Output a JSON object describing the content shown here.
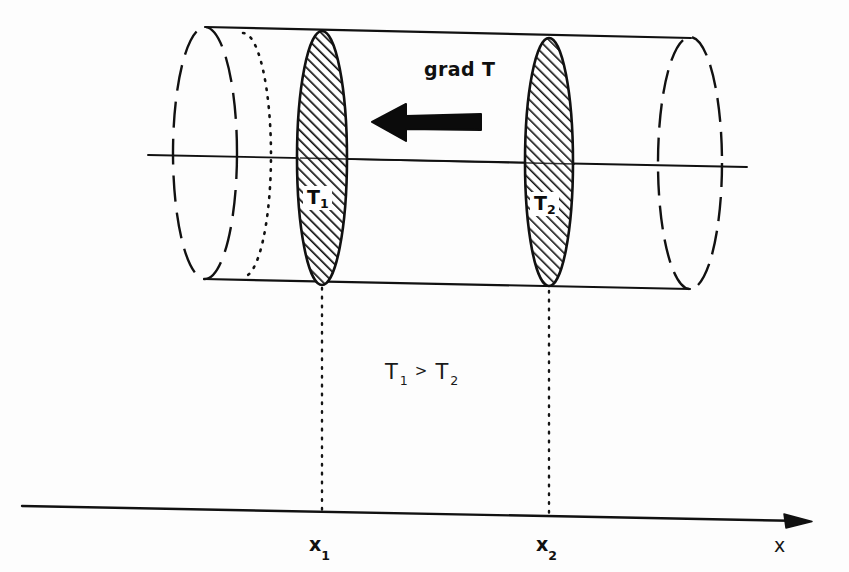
{
  "figure": {
    "background_color": "#fdfdfd",
    "ink_color": "#111111"
  },
  "labels": {
    "gradient": "grad T",
    "section_1": "T",
    "section_1_sub": "1",
    "section_2": "T",
    "section_2_sub": "2",
    "inequality_left": "T",
    "inequality_left_sub": "1",
    "inequality_operator": ">",
    "inequality_right": "T",
    "inequality_right_sub": "2",
    "tick_1": "x",
    "tick_1_sub": "1",
    "tick_2": "x",
    "tick_2_sub": "2",
    "axis_name": "x"
  },
  "geometry": {
    "cylinder": {
      "top_edge": {
        "x1": 205,
        "y1": 27,
        "x2": 691,
        "y2": 38
      },
      "bottom_edge": {
        "x1": 204,
        "y1": 279,
        "x2": 690,
        "y2": 289
      },
      "left_cap": {
        "cx": 205,
        "cy": 153,
        "rx": 32,
        "ry": 126,
        "style": "dashed"
      },
      "left_cap_hidden": {
        "cx": 243,
        "cy": 155,
        "rx": 28,
        "ry": 122,
        "style": "dotted"
      },
      "right_cap": {
        "cx": 690,
        "cy": 163,
        "rx": 32,
        "ry": 126,
        "style": "dashed"
      },
      "center_axis": {
        "x1": 148,
        "y1": 155,
        "x2": 747,
        "y2": 167
      }
    },
    "section_discs": [
      {
        "name": "T1",
        "cx": 322,
        "cy": 158,
        "rx": 25,
        "ry": 127,
        "hatched": true
      },
      {
        "name": "T2",
        "cx": 549,
        "cy": 162,
        "rx": 24,
        "ry": 124,
        "hatched": true
      }
    ],
    "gradient_arrow": {
      "tip_x": 372,
      "tail_x": 481,
      "y": 122,
      "shaft_thickness": 13,
      "head_half_height": 19,
      "head_length": 34,
      "direction": "left",
      "color": "#0b0b0b"
    },
    "projection_lines": [
      {
        "name": "x1-projection",
        "x": 322,
        "y_top": 288,
        "y_bottom": 513,
        "style": "dotted"
      },
      {
        "name": "x2-projection",
        "x": 549,
        "y_top": 291,
        "y_bottom": 518,
        "style": "dotted"
      }
    ],
    "x_axis": {
      "x1": 22,
      "y1": 506,
      "x2": 812,
      "y2": 521,
      "arrowhead_length": 22,
      "arrowhead_half_height": 7
    }
  }
}
